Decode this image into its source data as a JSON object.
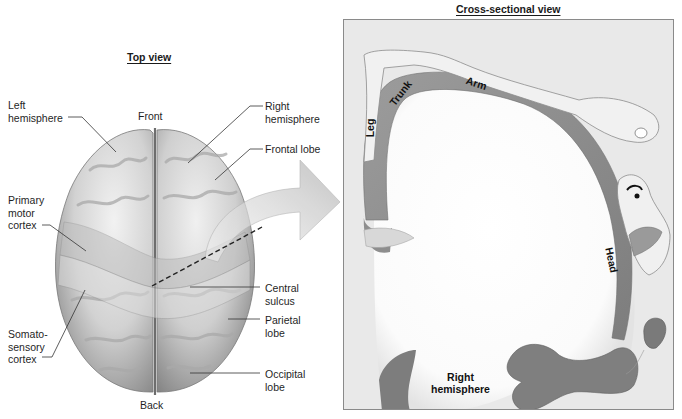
{
  "top_view": {
    "title": "Top view",
    "orientation": {
      "front": "Front",
      "back": "Back"
    },
    "labels_left": [
      {
        "id": "left-hemisphere",
        "text": "Left\nhemisphere"
      },
      {
        "id": "primary-motor-cortex",
        "text": "Primary\nmotor\ncortex"
      },
      {
        "id": "somatosensory-cortex",
        "text": "Somato-\nsensory\ncortex"
      }
    ],
    "labels_right": [
      {
        "id": "right-hemisphere",
        "text": "Right\nhemisphere"
      },
      {
        "id": "frontal-lobe",
        "text": "Frontal lobe"
      },
      {
        "id": "central-sulcus",
        "text": "Central\nsulcus"
      },
      {
        "id": "parietal-lobe",
        "text": "Parietal\nlobe"
      },
      {
        "id": "occipital-lobe",
        "text": "Occipital\nlobe"
      }
    ]
  },
  "cross_section": {
    "title": "Cross-sectional view",
    "body_part_labels": [
      "Leg",
      "Trunk",
      "Arm",
      "Head"
    ],
    "region_label": "Right\nhemisphere"
  },
  "colors": {
    "brain_surface": "#c9c9c9",
    "cortex_strip": "#8e8e8e",
    "panel_bg": "#e9e9e9",
    "white_matter": "#ffffff",
    "arrow": "#cfcfcf"
  }
}
